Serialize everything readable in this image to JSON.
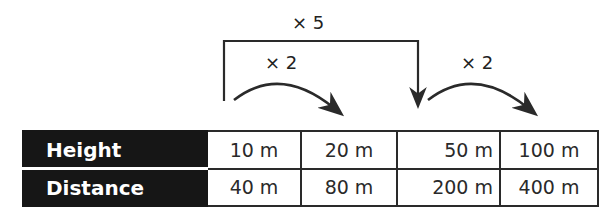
{
  "annotations": {
    "outer": "× 5",
    "inner_left": "× 2",
    "inner_right": "× 2"
  },
  "table": {
    "rows": [
      {
        "label": "Height",
        "values": [
          "10 m",
          "20 m",
          "50 m",
          "100 m"
        ]
      },
      {
        "label": "Distance",
        "values": [
          "40 m",
          "80 m",
          "200 m",
          "400 m"
        ]
      }
    ]
  },
  "colors": {
    "header_bg": "#161616",
    "line": "#2a2a2a"
  }
}
